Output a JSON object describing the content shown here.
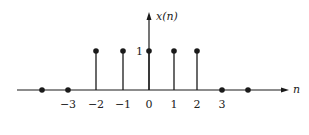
{
  "chart_data": {
    "type": "stem",
    "title": "",
    "xlabel": "n",
    "ylabel": "x(n)",
    "x": [
      -5,
      -4,
      -3,
      -2,
      -1,
      0,
      1,
      2,
      3,
      4
    ],
    "values": [
      0,
      0,
      0,
      1,
      1,
      1,
      1,
      1,
      0,
      0
    ],
    "x_tick_labels": [
      "−3",
      "−2",
      "−1",
      "0",
      "1",
      "2",
      "3"
    ],
    "x_tick_values": [
      -3,
      -2,
      -1,
      0,
      1,
      2,
      3
    ],
    "y_tick_labels": [
      "1"
    ],
    "y_tick_values": [
      1
    ],
    "grid": false,
    "legend": null
  },
  "colors": {
    "ink": "#1a1a1a",
    "background": "#ffffff"
  }
}
